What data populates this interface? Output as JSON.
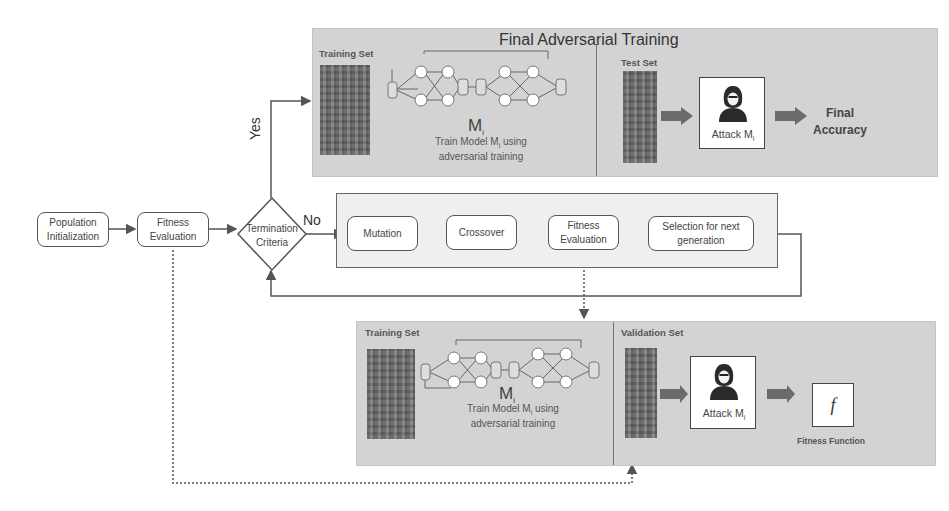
{
  "final_training": {
    "title": "Final Adversarial Training",
    "training_set_label": "Training Set",
    "test_set_label": "Test Set",
    "model_label": "M",
    "model_subscript": "i",
    "caption_line1": "Train Model M",
    "caption_sub": "i",
    "caption_line1_rest": " using",
    "caption_line2": "adversarial training",
    "attack_label": "Attack M",
    "attack_sub": "i",
    "result_line1": "Final",
    "result_line2": "Accuracy"
  },
  "flow": {
    "population_init_line1": "Population",
    "population_init_line2": "Initialization",
    "fitness_eval_line1": "Fitness",
    "fitness_eval_line2": "Evaluation",
    "termination_line1": "Termination",
    "termination_line2": "Criteria",
    "yes_label": "Yes",
    "no_label": "No"
  },
  "ga_loop": {
    "mutation": "Mutation",
    "crossover": "Crossover",
    "fitness_line1": "Fitness",
    "fitness_line2": "Evaluation",
    "selection_line1": "Selection for next",
    "selection_line2": "generation"
  },
  "fitness_detail": {
    "training_set_label": "Training Set",
    "validation_set_label": "Validation Set",
    "model_label": "M",
    "model_subscript": "i",
    "caption_line1": "Train Model M",
    "caption_sub": "i",
    "caption_line1_rest": " using",
    "caption_line2": "adversarial training",
    "attack_label": "Attack M",
    "attack_sub": "i",
    "fitness_symbol": "f",
    "fitness_function_label": "Fitness Function"
  },
  "colors": {
    "panel_gray": "#d3d3d3",
    "line": "#555555",
    "arrow_fill": "#6b6b6b"
  }
}
